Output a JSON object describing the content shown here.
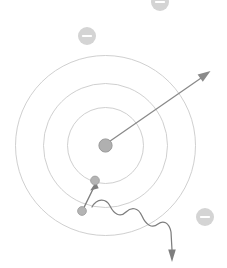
{
  "diagram": {
    "type": "atomic-model-schematic",
    "canvas": {
      "width": 227,
      "height": 268,
      "background": "#ffffff"
    },
    "colors": {
      "orbit_stroke": "#c9c9c9",
      "nucleus_fill": "#b0b0b0",
      "nucleus_stroke": "#9a9a9a",
      "electron_fill": "#b4b4b4",
      "electron_stroke": "#9a9a9a",
      "badge_fill": "#d4d4d4",
      "badge_sign": "#ffffff",
      "vector_stroke": "#8a8a8a",
      "jump_stroke": "#7e7e7e",
      "photon_stroke": "#7e7e7e"
    },
    "nucleus": {
      "label": "nucleus",
      "cx": 105.5,
      "cy": 145.5,
      "r": 6.5
    },
    "orbits": [
      {
        "label": "orbit-inner",
        "shell": 1,
        "cx": 105.5,
        "cy": 145.5,
        "r": 38
      },
      {
        "label": "orbit-middle",
        "shell": 2,
        "cx": 105.5,
        "cy": 145.5,
        "r": 62
      },
      {
        "label": "orbit-outer",
        "shell": 3,
        "cx": 105.5,
        "cy": 145.5,
        "r": 90
      }
    ],
    "electrons_on_orbit": [
      {
        "label": "electron-destination",
        "cx": 95,
        "cy": 180.5,
        "r": 4.4,
        "shell": 1
      },
      {
        "label": "electron-origin",
        "cx": 82,
        "cy": 211,
        "r": 4.4,
        "shell": 2
      }
    ],
    "charge_badges": [
      {
        "label": "negative-charge-top",
        "cx": 160,
        "cy": 2,
        "r": 9,
        "sign": "minus"
      },
      {
        "label": "negative-charge-upper-left",
        "cx": 87,
        "cy": 36,
        "r": 9,
        "sign": "minus"
      },
      {
        "label": "negative-charge-lower-right",
        "cx": 205,
        "cy": 217,
        "r": 9,
        "sign": "minus"
      }
    ],
    "radius_vector": {
      "label": "radius-vector-arrow",
      "from": {
        "x": 108,
        "y": 142
      },
      "to": {
        "x": 209,
        "y": 72
      },
      "stroke_width": 1.3
    },
    "transition_arrow": {
      "label": "electron-jump-arrow",
      "from": {
        "x": 83,
        "y": 208
      },
      "to": {
        "x": 95.5,
        "y": 183
      },
      "stroke_width": 1.4
    },
    "emitted_photon": {
      "label": "emitted-photon-wave",
      "description": "sinusoidal wave emitted outward with arrowhead",
      "start": {
        "x": 92,
        "y": 207
      },
      "end": {
        "x": 172,
        "y": 252
      },
      "arrow_tip": {
        "x": 172,
        "y": 260
      },
      "cycles": 3,
      "amplitude": 7,
      "stroke_width": 1.3
    }
  }
}
